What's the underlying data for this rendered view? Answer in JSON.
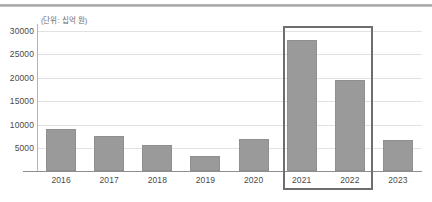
{
  "chart_data": {
    "type": "bar",
    "title": "",
    "subtitle": "",
    "unit_label": "(단위: 십억 원)",
    "xlabel": "",
    "ylabel": "",
    "categories": [
      "2016",
      "2017",
      "2018",
      "2019",
      "2020",
      "2021",
      "2022",
      "2023"
    ],
    "values": [
      9100,
      7500,
      5700,
      3200,
      7000,
      28000,
      19500,
      6700
    ],
    "ylim": [
      0,
      30000
    ],
    "yticks": [
      5000,
      10000,
      15000,
      20000,
      25000,
      30000
    ],
    "ytick_labels": [
      "5000",
      "10000",
      "15000",
      "20000",
      "25000",
      "30000"
    ],
    "grid": true,
    "legend": null,
    "bar_color": "#9a9a9a",
    "gridline_color": "#e2e2e2",
    "axis_color": "#8e8e8e",
    "annotations": [
      {
        "name": "highlight-box",
        "type": "rectangle",
        "covers": [
          "2021",
          "2022"
        ],
        "border_color": "#6e6e6e"
      }
    ]
  }
}
